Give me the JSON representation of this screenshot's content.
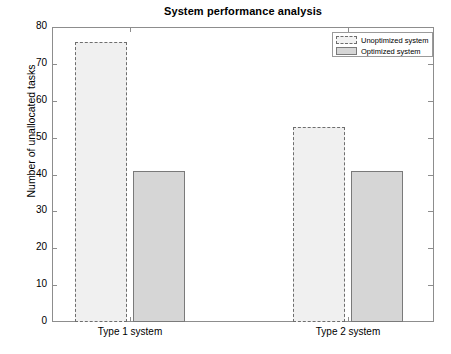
{
  "chart_data": {
    "type": "bar",
    "title": "System performance analysis",
    "xlabel": "",
    "ylabel": "Number of unallocated tasks",
    "categories": [
      "Type 1 system",
      "Type 2 system"
    ],
    "series": [
      {
        "name": "Unoptimized system",
        "values": [
          76,
          53
        ],
        "fill": "#f0f0f0",
        "edge": "#6e6e6e",
        "linestyle": "dashed"
      },
      {
        "name": "Optimized system",
        "values": [
          41,
          41
        ],
        "fill": "#d6d6d6",
        "edge": "#7a7a7a",
        "linestyle": "solid"
      }
    ],
    "ylim": [
      0,
      80
    ],
    "yticks": [
      0,
      10,
      20,
      30,
      40,
      50,
      60,
      70,
      80
    ],
    "ytick_labels": [
      "0",
      "10",
      "20",
      "30",
      "40",
      "50",
      "60",
      "70",
      "80"
    ],
    "grid": false,
    "legend_position": "upper right"
  },
  "legend": {
    "items": [
      {
        "label": "Unoptimized system"
      },
      {
        "label": "Optimized system"
      }
    ]
  },
  "axes": {
    "y_title": "Number of unallocated tasks",
    "x_categories": [
      "Type 1 system",
      "Type 2 system"
    ]
  }
}
